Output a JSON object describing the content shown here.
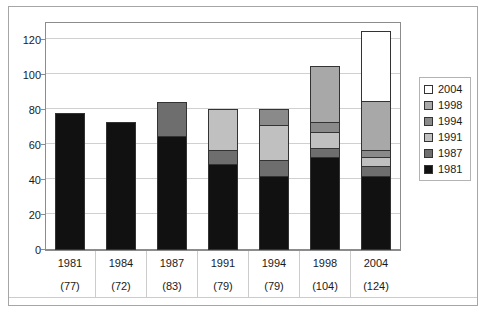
{
  "chart_data": {
    "type": "bar",
    "subtype": "stacked-column",
    "title": "",
    "xlabel": "",
    "ylabel": "",
    "ylim": [
      0,
      130
    ],
    "yticks": [
      0,
      20,
      40,
      60,
      80,
      100,
      120
    ],
    "ytick_labels": [
      "0",
      "20",
      "40",
      "60",
      "80",
      "100",
      "120"
    ],
    "grid": true,
    "legend_position": "right",
    "categories": [
      "1981",
      "1984",
      "1987",
      "1991",
      "1994",
      "1998",
      "2004"
    ],
    "category_sublabels": [
      "(77)",
      "(72)",
      "(83)",
      "(79)",
      "(79)",
      "(104)",
      "(124)"
    ],
    "totals": [
      77,
      72,
      83,
      79,
      79,
      104,
      124
    ],
    "series": [
      {
        "name": "1981",
        "color": "#111111",
        "values": [
          77,
          72,
          64,
          48,
          41,
          52,
          41
        ]
      },
      {
        "name": "1987",
        "color": "#6e6e6e",
        "values": [
          0,
          0,
          19,
          8,
          9,
          5,
          6
        ]
      },
      {
        "name": "1991",
        "color": "#c0c0c0",
        "values": [
          0,
          0,
          0,
          23,
          20,
          9,
          5
        ]
      },
      {
        "name": "1994",
        "color": "#8a8a8a",
        "values": [
          0,
          0,
          0,
          0,
          9,
          6,
          4
        ]
      },
      {
        "name": "1998",
        "color": "#a8a8a8",
        "values": [
          0,
          0,
          0,
          0,
          0,
          32,
          28
        ]
      },
      {
        "name": "2004",
        "color": "#ffffff",
        "values": [
          0,
          0,
          0,
          0,
          0,
          0,
          40
        ]
      }
    ],
    "legend_entries": [
      {
        "label": "2004",
        "color": "#ffffff"
      },
      {
        "label": "1998",
        "color": "#a8a8a8"
      },
      {
        "label": "1994",
        "color": "#8a8a8a"
      },
      {
        "label": "1991",
        "color": "#c0c0c0"
      },
      {
        "label": "1987",
        "color": "#6e6e6e"
      },
      {
        "label": "1981",
        "color": "#111111"
      }
    ],
    "colors": {
      "grid": "#d0d0d0",
      "axis": "#8c8c8c",
      "frame": "#a6a6a6",
      "bar_outline": "#333333",
      "text": "#1a1a1a"
    }
  }
}
